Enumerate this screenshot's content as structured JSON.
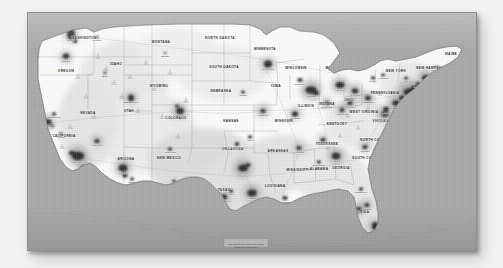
{
  "background": {
    "color": "#f2f2f2"
  },
  "artwork": {
    "name": "us-population-map-canvas",
    "medium": "canvas-print",
    "border_color": "#8e8e8e",
    "water_color": "#a9a9a9",
    "land_color": "#fbfbfb",
    "urban_color": "#2f2f2f",
    "title_visible": false
  },
  "map": {
    "name": "united-states-contiguous",
    "projection_look": "albers-like",
    "caption": "U.S. Population Density",
    "states": [
      {
        "abbr": "WA",
        "label": "WASHINGTON",
        "x": 56,
        "y": 26
      },
      {
        "abbr": "OR",
        "label": "OREGON",
        "x": 38,
        "y": 59
      },
      {
        "abbr": "CA",
        "label": "CALIFORNIA",
        "x": 36,
        "y": 124
      },
      {
        "abbr": "NV",
        "label": "NEVADA",
        "x": 60,
        "y": 101
      },
      {
        "abbr": "ID",
        "label": "IDAHO",
        "x": 88,
        "y": 52
      },
      {
        "abbr": "MT",
        "label": "MONTANA",
        "x": 133,
        "y": 30
      },
      {
        "abbr": "WY",
        "label": "WYOMING",
        "x": 131,
        "y": 74
      },
      {
        "abbr": "UT",
        "label": "UTAH",
        "x": 101,
        "y": 99
      },
      {
        "abbr": "AZ",
        "label": "ARIZONA",
        "x": 98,
        "y": 147
      },
      {
        "abbr": "NM",
        "label": "NEW MEXICO",
        "x": 141,
        "y": 146
      },
      {
        "abbr": "CO",
        "label": "COLORADO",
        "x": 148,
        "y": 106
      },
      {
        "abbr": "ND",
        "label": "NORTH DAKOTA",
        "x": 192,
        "y": 26
      },
      {
        "abbr": "SD",
        "label": "SOUTH DAKOTA",
        "x": 196,
        "y": 55
      },
      {
        "abbr": "NE",
        "label": "NEBRASKA",
        "x": 193,
        "y": 79
      },
      {
        "abbr": "KS",
        "label": "KANSAS",
        "x": 203,
        "y": 109
      },
      {
        "abbr": "OK",
        "label": "OKLAHOMA",
        "x": 205,
        "y": 137
      },
      {
        "abbr": "TX",
        "label": "TEXAS",
        "x": 196,
        "y": 178
      },
      {
        "abbr": "MN",
        "label": "MINNESOTA",
        "x": 237,
        "y": 37
      },
      {
        "abbr": "IA",
        "label": "IOWA",
        "x": 248,
        "y": 74
      },
      {
        "abbr": "MO",
        "label": "MISSOURI",
        "x": 256,
        "y": 109
      },
      {
        "abbr": "AR",
        "label": "ARKANSAS",
        "x": 250,
        "y": 139
      },
      {
        "abbr": "LA",
        "label": "LOUISIANA",
        "x": 247,
        "y": 174
      },
      {
        "abbr": "WI",
        "label": "WISCONSIN",
        "x": 268,
        "y": 56
      },
      {
        "abbr": "IL",
        "label": "ILLINOIS",
        "x": 278,
        "y": 94
      },
      {
        "abbr": "MS",
        "label": "MISSISSIPPI",
        "x": 270,
        "y": 158
      },
      {
        "abbr": "AL",
        "label": "ALABAMA",
        "x": 291,
        "y": 157
      },
      {
        "abbr": "MI",
        "label": "MICHIGAN",
        "x": 307,
        "y": 56
      },
      {
        "abbr": "IN",
        "label": "INDIANA",
        "x": 299,
        "y": 92
      },
      {
        "abbr": "KY",
        "label": "KENTUCKY",
        "x": 309,
        "y": 112
      },
      {
        "abbr": "TN",
        "label": "TENNESSEE",
        "x": 299,
        "y": 132
      },
      {
        "abbr": "OH",
        "label": "OHIO",
        "x": 321,
        "y": 88
      },
      {
        "abbr": "GA",
        "label": "GEORGIA",
        "x": 313,
        "y": 156
      },
      {
        "abbr": "FL",
        "label": "FLORIDA",
        "x": 333,
        "y": 200
      },
      {
        "abbr": "SC",
        "label": "SOUTH CAROLINA",
        "x": 341,
        "y": 146
      },
      {
        "abbr": "NC",
        "label": "NORTH CAROLINA",
        "x": 349,
        "y": 128
      },
      {
        "abbr": "VA",
        "label": "VIRGINIA",
        "x": 353,
        "y": 109
      },
      {
        "abbr": "WV",
        "label": "WEST VIRGINIA",
        "x": 336,
        "y": 100
      },
      {
        "abbr": "PA",
        "label": "PENNSYLVANIA",
        "x": 357,
        "y": 81
      },
      {
        "abbr": "NY",
        "label": "NEW YORK",
        "x": 368,
        "y": 59
      },
      {
        "abbr": "NH",
        "label": "NEW HAMPSHIRE",
        "x": 404,
        "y": 56
      },
      {
        "abbr": "ME",
        "label": "MAINE",
        "x": 423,
        "y": 42
      }
    ],
    "cities": [
      {
        "name": "Seattle",
        "x": 43,
        "y": 22,
        "size": 3.3
      },
      {
        "name": "Portland",
        "x": 38,
        "y": 44,
        "size": 2.8
      },
      {
        "name": "Spokane",
        "x": 69,
        "y": 24,
        "size": 1.8
      },
      {
        "name": "Boise",
        "x": 77,
        "y": 60,
        "size": 1.8
      },
      {
        "name": "Sacramento",
        "x": 26,
        "y": 101,
        "size": 2.2
      },
      {
        "name": "San Francisco",
        "x": 20,
        "y": 109,
        "size": 3.0
      },
      {
        "name": "Fresno",
        "x": 33,
        "y": 121,
        "size": 2.0
      },
      {
        "name": "Los Angeles",
        "x": 50,
        "y": 143,
        "size": 4.4
      },
      {
        "name": "San Diego",
        "x": 56,
        "y": 155,
        "size": 2.8
      },
      {
        "name": "Las Vegas",
        "x": 69,
        "y": 128,
        "size": 2.4
      },
      {
        "name": "Salt Lake City",
        "x": 103,
        "y": 85,
        "size": 2.6
      },
      {
        "name": "Denver",
        "x": 152,
        "y": 98,
        "size": 3.2
      },
      {
        "name": "Phoenix",
        "x": 95,
        "y": 155,
        "size": 3.6
      },
      {
        "name": "Tucson",
        "x": 104,
        "y": 166,
        "size": 2.0
      },
      {
        "name": "Albuquerque",
        "x": 142,
        "y": 136,
        "size": 2.2
      },
      {
        "name": "El Paso",
        "x": 146,
        "y": 168,
        "size": 2.2
      },
      {
        "name": "Billings",
        "x": 137,
        "y": 40,
        "size": 1.4
      },
      {
        "name": "Minneapolis",
        "x": 240,
        "y": 51,
        "size": 3.4
      },
      {
        "name": "Milwaukee",
        "x": 272,
        "y": 67,
        "size": 2.6
      },
      {
        "name": "Chicago",
        "x": 283,
        "y": 77,
        "size": 4.6
      },
      {
        "name": "Detroit",
        "x": 312,
        "y": 72,
        "size": 3.8
      },
      {
        "name": "Cleveland",
        "x": 327,
        "y": 78,
        "size": 3.0
      },
      {
        "name": "Columbus",
        "x": 322,
        "y": 90,
        "size": 2.4
      },
      {
        "name": "Cincinnati",
        "x": 314,
        "y": 97,
        "size": 2.4
      },
      {
        "name": "Indianapolis",
        "x": 299,
        "y": 90,
        "size": 2.4
      },
      {
        "name": "St. Louis",
        "x": 267,
        "y": 101,
        "size": 2.8
      },
      {
        "name": "Kansas City",
        "x": 235,
        "y": 98,
        "size": 2.6
      },
      {
        "name": "Omaha",
        "x": 215,
        "y": 79,
        "size": 2.0
      },
      {
        "name": "Oklahoma City",
        "x": 209,
        "y": 131,
        "size": 2.2
      },
      {
        "name": "Tulsa",
        "x": 222,
        "y": 124,
        "size": 2.0
      },
      {
        "name": "Dallas",
        "x": 215,
        "y": 155,
        "size": 3.6
      },
      {
        "name": "Austin",
        "x": 203,
        "y": 178,
        "size": 2.2
      },
      {
        "name": "San Antonio",
        "x": 196,
        "y": 184,
        "size": 2.8
      },
      {
        "name": "Houston",
        "x": 224,
        "y": 180,
        "size": 3.8
      },
      {
        "name": "New Orleans",
        "x": 257,
        "y": 185,
        "size": 2.4
      },
      {
        "name": "Memphis",
        "x": 271,
        "y": 135,
        "size": 2.4
      },
      {
        "name": "Nashville",
        "x": 295,
        "y": 127,
        "size": 2.4
      },
      {
        "name": "Birmingham",
        "x": 291,
        "y": 149,
        "size": 2.0
      },
      {
        "name": "Atlanta",
        "x": 308,
        "y": 143,
        "size": 3.4
      },
      {
        "name": "Jacksonville",
        "x": 333,
        "y": 176,
        "size": 2.2
      },
      {
        "name": "Orlando",
        "x": 339,
        "y": 192,
        "size": 2.4
      },
      {
        "name": "Tampa",
        "x": 331,
        "y": 196,
        "size": 2.6
      },
      {
        "name": "Miami",
        "x": 347,
        "y": 213,
        "size": 3.0
      },
      {
        "name": "Charlotte",
        "x": 337,
        "y": 134,
        "size": 2.4
      },
      {
        "name": "Raleigh",
        "x": 353,
        "y": 128,
        "size": 2.2
      },
      {
        "name": "Norfolk",
        "x": 364,
        "y": 117,
        "size": 2.2
      },
      {
        "name": "Washington D.C.",
        "x": 357,
        "y": 101,
        "size": 3.4
      },
      {
        "name": "Baltimore",
        "x": 358,
        "y": 96,
        "size": 2.6
      },
      {
        "name": "Philadelphia",
        "x": 368,
        "y": 90,
        "size": 3.4
      },
      {
        "name": "Pittsburgh",
        "x": 340,
        "y": 85,
        "size": 2.6
      },
      {
        "name": "New York",
        "x": 381,
        "y": 79,
        "size": 5.0
      },
      {
        "name": "Hartford",
        "x": 390,
        "y": 71,
        "size": 2.2
      },
      {
        "name": "Providence",
        "x": 396,
        "y": 71,
        "size": 2.0
      },
      {
        "name": "Boston",
        "x": 398,
        "y": 65,
        "size": 3.4
      },
      {
        "name": "Buffalo",
        "x": 345,
        "y": 65,
        "size": 2.2
      },
      {
        "name": "Rochester",
        "x": 355,
        "y": 62,
        "size": 2.0
      },
      {
        "name": "Albany",
        "x": 378,
        "y": 65,
        "size": 2.0
      },
      {
        "name": "Portland ME",
        "x": 409,
        "y": 54,
        "size": 1.6
      }
    ]
  },
  "caption_block": {
    "name": "map-caption",
    "line1": "Population Density of the United States",
    "line2": "persons per square mile",
    "x": 218,
    "y": 232
  }
}
